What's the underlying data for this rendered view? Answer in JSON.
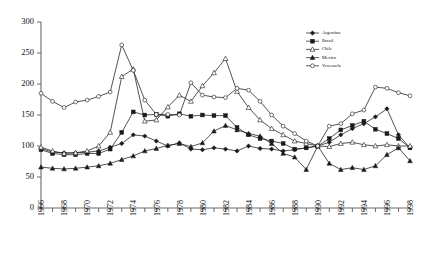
{
  "chart_data": {
    "type": "line",
    "title": "",
    "subtitle": "",
    "xlabel": "",
    "ylabel": "",
    "xlim": [
      1966,
      1998
    ],
    "ylim": [
      0,
      300
    ],
    "yticks": [
      0,
      50,
      100,
      150,
      200,
      250,
      300
    ],
    "ytick_labels": [
      "0",
      "50",
      "100",
      "150",
      "200",
      "250",
      "300"
    ],
    "grid": false,
    "legend_position": "top-right",
    "x": [
      1966,
      1967,
      1968,
      1969,
      1970,
      1971,
      1972,
      1973,
      1974,
      1975,
      1976,
      1977,
      1978,
      1979,
      1980,
      1981,
      1982,
      1983,
      1984,
      1985,
      1986,
      1987,
      1988,
      1989,
      1990,
      1991,
      1992,
      1993,
      1994,
      1995,
      1996,
      1997,
      1998
    ],
    "xtick_labels": [
      "1966",
      "1968",
      "1970",
      "1972",
      "1974",
      "1976",
      "1978",
      "1980",
      "1982",
      "1984",
      "1986",
      "1988",
      "1990",
      "1992",
      "1994",
      "1996",
      "1998"
    ],
    "series": [
      {
        "name": "Argentina",
        "marker": "filled-diamond",
        "values": [
          96,
          90,
          89,
          89,
          90,
          92,
          98,
          104,
          118,
          116,
          108,
          100,
          105,
          95,
          94,
          97,
          95,
          92,
          100,
          96,
          95,
          92,
          94,
          97,
          100,
          106,
          118,
          128,
          136,
          147,
          160,
          118,
          97
        ]
      },
      {
        "name": "Brazil",
        "marker": "filled-square",
        "values": [
          94,
          88,
          86,
          86,
          88,
          88,
          95,
          122,
          155,
          150,
          151,
          148,
          152,
          148,
          150,
          149,
          149,
          130,
          118,
          112,
          108,
          104,
          95,
          97,
          100,
          112,
          126,
          133,
          140,
          127,
          120,
          112,
          97
        ]
      },
      {
        "name": "Chile",
        "marker": "open-triangle",
        "values": [
          98,
          92,
          88,
          89,
          92,
          100,
          122,
          212,
          224,
          140,
          142,
          163,
          182,
          172,
          197,
          218,
          241,
          188,
          162,
          142,
          128,
          118,
          108,
          104,
          100,
          99,
          104,
          106,
          102,
          100,
          102,
          100,
          100
        ]
      },
      {
        "name": "Mexico",
        "marker": "filled-triangle",
        "values": [
          66,
          64,
          63,
          64,
          66,
          68,
          72,
          78,
          84,
          92,
          96,
          101,
          104,
          99,
          105,
          124,
          133,
          126,
          120,
          116,
          104,
          88,
          82,
          62,
          100,
          72,
          62,
          65,
          62,
          68,
          86,
          97,
          76
        ]
      },
      {
        "name": "Venezuela",
        "marker": "open-circle",
        "values": [
          185,
          172,
          162,
          171,
          174,
          180,
          187,
          263,
          222,
          174,
          151,
          151,
          150,
          202,
          182,
          179,
          178,
          193,
          190,
          172,
          150,
          132,
          120,
          108,
          100,
          132,
          136,
          152,
          158,
          195,
          193,
          186,
          181
        ]
      }
    ]
  },
  "legend": {
    "items": [
      {
        "label": "Argentina"
      },
      {
        "label": "Brazil"
      },
      {
        "label": "Chile"
      },
      {
        "label": "Mexico"
      },
      {
        "label": "Venezuela"
      }
    ]
  },
  "colors": {
    "axis": "#6b6b6b",
    "line": "#1a1a1a",
    "background": "#ffffff"
  }
}
